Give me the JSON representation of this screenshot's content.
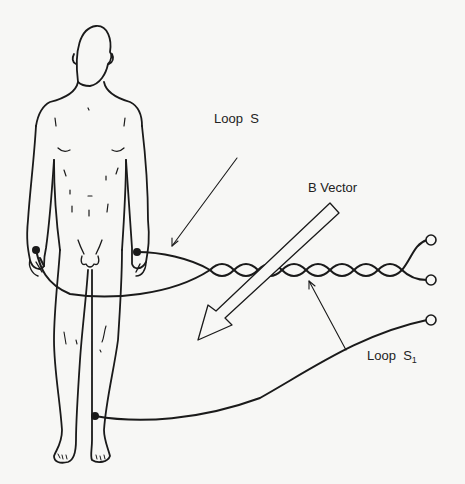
{
  "diagram": {
    "type": "technical-illustration",
    "labels": {
      "loop_s": "Loop  S",
      "b_vector": "B Vector",
      "loop_s1_main": "Loop  S",
      "loop_s1_sub": "1"
    },
    "elements": [
      {
        "id": "human-figure",
        "description": "standing human figure, front view"
      },
      {
        "id": "loop-s",
        "description": "wire loop from right wrist to left wrist, twisted pair leading right to two terminals"
      },
      {
        "id": "loop-s1",
        "description": "wire from right ankle leading to a single terminal, combined with twisted pair"
      },
      {
        "id": "b-vector-arrow",
        "description": "large hollow arrow pointing down-left, representing magnetic field vector B"
      }
    ],
    "terminals": 3,
    "electrodes": [
      "right-wrist",
      "left-wrist",
      "right-ankle"
    ],
    "colors": {
      "ink": "#1a1a1a",
      "paper": "#f7f7f5"
    }
  }
}
